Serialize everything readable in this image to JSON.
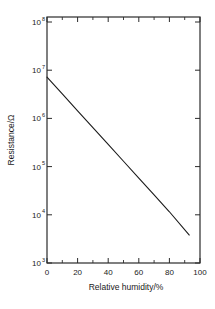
{
  "chart_data": {
    "type": "line",
    "title": "",
    "xlabel": "Relative humidity/%",
    "ylabel": "Resistance/Ω",
    "xlim": [
      0,
      100
    ],
    "ylim": [
      1000,
      100000000
    ],
    "yscale": "log",
    "xscale": "linear",
    "grid": false,
    "legend": false,
    "frame": "box",
    "x_ticks_major": [
      0,
      20,
      40,
      60,
      80,
      100
    ],
    "x_tick_labels": [
      "0",
      "20",
      "40",
      "60",
      "80",
      "100"
    ],
    "x_ticks_minor": [
      10,
      30,
      50,
      70,
      90
    ],
    "y_ticks_major": [
      1000,
      10000,
      100000,
      1000000,
      10000000,
      100000000
    ],
    "y_tick_labels": [
      "10",
      "10",
      "10",
      "10",
      "10",
      "10"
    ],
    "y_tick_exponents": [
      "3",
      "4",
      "5",
      "6",
      "7",
      "8"
    ],
    "series": [
      {
        "name": "resistance",
        "color": "#1a1a1a",
        "x": [
          0,
          10,
          20,
          30,
          40,
          50,
          60,
          70,
          80,
          93
        ],
        "y": [
          6000000,
          2730000,
          1242000,
          565000,
          257000,
          117000,
          53200,
          24200,
          11000,
          3700
        ]
      }
    ]
  },
  "axis": {
    "x_title": "Relative humidity/%",
    "y_title": "Resistance/Ω",
    "mantissa": "10"
  },
  "colors": {
    "line": "#1a1a1a",
    "frame": "#2b2b2b",
    "text": "#1a1a1a",
    "background": "#ffffff"
  }
}
